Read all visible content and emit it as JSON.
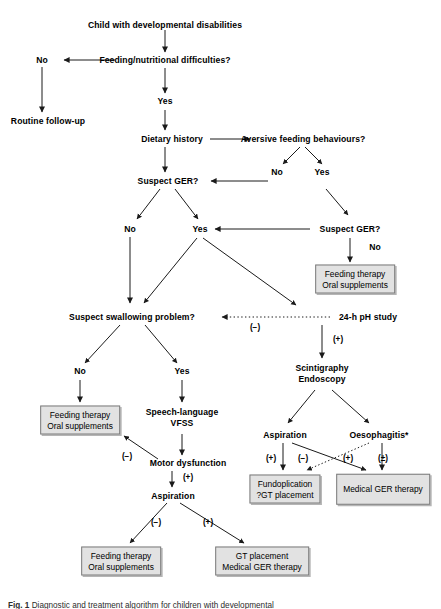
{
  "figure": {
    "caption_label": "Fig. 1",
    "caption_text": "Diagnostic and treatment algorithm for children with developmental",
    "footnote_marker": "*"
  },
  "nodes": {
    "root": "Child with developmental disabilities",
    "feeding_difficulties": "Feeding/nutritional difficulties?",
    "no_1": "No",
    "routine_followup": "Routine follow-up",
    "yes_1": "Yes",
    "dietary_history": "Dietary history",
    "aversive": "Aversive feeding behaviours?",
    "aversive_no": "No",
    "aversive_yes": "Yes",
    "suspect_ger_left": "Suspect GER?",
    "suspect_ger_right": "Suspect GER?",
    "ger_left_no": "No",
    "ger_left_yes": "Yes",
    "ger_right_no": "No",
    "swallowing": "Suspect swallowing problem?",
    "ph_study": "24-h pH study",
    "swallow_no": "No",
    "swallow_yes": "Yes",
    "speech_vfss_line1": "Speech-language",
    "speech_vfss_line2": "VFSS",
    "motor_dysfunction": "Motor dysfunction",
    "aspiration_left": "Aspiration",
    "scintigraphy_line1": "Scintigraphy",
    "scintigraphy_line2": "Endoscopy",
    "aspiration_right": "Aspiration",
    "oesophagitis": "Oesophagitis*"
  },
  "boxes": {
    "feeding_oral_right": {
      "line1": "Feeding therapy",
      "line2": "Oral supplements"
    },
    "feeding_oral_left": {
      "line1": "Feeding therapy",
      "line2": "Oral supplements"
    },
    "feeding_oral_bottom": {
      "line1": "Feeding therapy",
      "line2": "Oral supplements"
    },
    "gt_medical": {
      "line1": "GT placement",
      "line2": "Medical GER therapy"
    },
    "fundoplication": {
      "line1": "Fundoplication",
      "line2": "?GT placement"
    },
    "medical_ger": {
      "line1": "Medical GER therapy"
    }
  },
  "edge_labels": {
    "ph_negative": "(−)",
    "ph_positive": "(+)",
    "motor_negative": "(−)",
    "motor_positive": "(+)",
    "asp_left_negative": "(−)",
    "asp_left_positive": "(+)",
    "asp_right_positive": "(+)",
    "asp_right_negative": "(−)",
    "oeso_positive": "(+)",
    "oeso_plusminus": "(±)"
  },
  "colors": {
    "box_fill": "#e2e2e2",
    "box_border": "#7a7a7a",
    "line": "#1a1a1a",
    "text": "#000000"
  }
}
